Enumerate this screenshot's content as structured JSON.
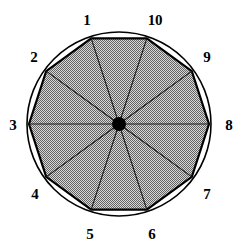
{
  "figure": {
    "name": "inscribed-regular-decagon",
    "width": 242,
    "height": 251,
    "background_color": "#FFFFFF"
  },
  "geometry": {
    "center": {
      "x": 119,
      "y": 124
    },
    "circle_radius": 92,
    "polygon_radius": 90,
    "sides": 10,
    "center_dot_radius": 7,
    "first_vertex_angle_deg": 108,
    "angle_step_deg": -36
  },
  "style": {
    "outline_color": "#000000",
    "polygon_stroke_color": "#000000",
    "polygon_stroke_width": 2.2,
    "circle_stroke_width": 1.6,
    "spoke_color": "#1a1a1a",
    "spoke_width": 1.1,
    "fill_color": "#9a9a9a",
    "fill_color_light": "#cccccc",
    "center_dot_color": "#000000",
    "label_color": "#000000"
  },
  "labels": [
    {
      "id": "vertex-1",
      "text": "1",
      "x": 87,
      "y": 20
    },
    {
      "id": "vertex-2",
      "text": "2",
      "x": 34,
      "y": 57
    },
    {
      "id": "vertex-3",
      "text": "3",
      "x": 13,
      "y": 125
    },
    {
      "id": "vertex-4",
      "text": "4",
      "x": 35,
      "y": 194
    },
    {
      "id": "vertex-5",
      "text": "5",
      "x": 90,
      "y": 234
    },
    {
      "id": "vertex-6",
      "text": "6",
      "x": 152,
      "y": 234
    },
    {
      "id": "vertex-7",
      "text": "7",
      "x": 207,
      "y": 194
    },
    {
      "id": "vertex-8",
      "text": "8",
      "x": 229,
      "y": 125
    },
    {
      "id": "vertex-9",
      "text": "9",
      "x": 207,
      "y": 57
    },
    {
      "id": "vertex-10",
      "text": "10",
      "x": 155,
      "y": 20
    }
  ]
}
